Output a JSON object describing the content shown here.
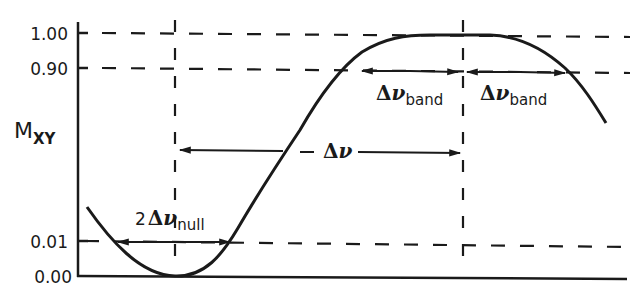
{
  "diagram": {
    "y_axis_label": "M",
    "y_axis_label_sub": "XY",
    "y_ticks": [
      {
        "label": "1.00",
        "value": 1.0
      },
      {
        "label": "0.90",
        "value": 0.9
      },
      {
        "label": "0.01",
        "value": 0.01
      },
      {
        "label": "0.00",
        "value": 0.0
      }
    ],
    "annotations": {
      "null_width": {
        "coef": "2",
        "symbol": "Δ",
        "var": "ν",
        "sub": "null"
      },
      "transition": {
        "symbol": "Δ",
        "var": "ν"
      },
      "band_left": {
        "symbol": "Δ",
        "var": "ν",
        "sub": "band"
      },
      "band_right": {
        "symbol": "Δ",
        "var": "ν",
        "sub": "band"
      }
    },
    "colors": {
      "ink": "#1a1a1a",
      "background": "#ffffff"
    }
  }
}
